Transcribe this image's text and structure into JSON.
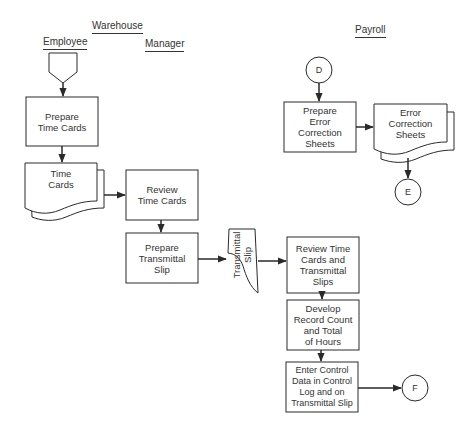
{
  "lanes": {
    "warehouse": "Warehouse",
    "employee": "Employee",
    "manager": "Manager",
    "payroll": "Payroll"
  },
  "nodes": {
    "prepare_time_cards": {
      "type": "process",
      "line1": "Prepare",
      "line2": "Time Cards"
    },
    "time_cards": {
      "type": "document-multiple",
      "line1": "Time",
      "line2": "Cards"
    },
    "review_time_cards": {
      "type": "process",
      "line1": "Review",
      "line2": "Time Cards"
    },
    "prepare_transmittal_slip": {
      "type": "process",
      "line1": "Prepare",
      "line2": "Transmittal",
      "line3": "Slip"
    },
    "transmittal_slip": {
      "type": "document",
      "line1": "Transmittal",
      "line2": "Slip"
    },
    "review_time_cards_slips": {
      "type": "process",
      "line1": "Review Time",
      "line2": "Cards and",
      "line3": "Transmittal",
      "line4": "Slips"
    },
    "develop_record_count": {
      "type": "process",
      "line1": "Develop",
      "line2": "Record Count",
      "line3": "and Total",
      "line4": "of Hours"
    },
    "enter_control_data": {
      "type": "process",
      "line1": "Enter Control",
      "line2": "Data in Control",
      "line3": "Log and on",
      "line4": "Transmittal Slip"
    },
    "prepare_error_correction": {
      "type": "process",
      "line1": "Prepare",
      "line2": "Error",
      "line3": "Correction",
      "line4": "Sheets"
    },
    "error_correction_sheets": {
      "type": "document-multiple",
      "line1": "Error",
      "line2": "Correction",
      "line3": "Sheets"
    }
  },
  "connectors": {
    "start": {
      "type": "off-page-connector",
      "label": ""
    },
    "D": {
      "type": "on-page-connector",
      "label": "D"
    },
    "E": {
      "type": "on-page-connector",
      "label": "E"
    },
    "F": {
      "type": "on-page-connector",
      "label": "F"
    }
  },
  "edges": [
    [
      "start",
      "prepare_time_cards"
    ],
    [
      "prepare_time_cards",
      "time_cards"
    ],
    [
      "time_cards",
      "review_time_cards"
    ],
    [
      "review_time_cards",
      "prepare_transmittal_slip"
    ],
    [
      "prepare_transmittal_slip",
      "transmittal_slip"
    ],
    [
      "transmittal_slip",
      "review_time_cards_slips"
    ],
    [
      "review_time_cards_slips",
      "develop_record_count"
    ],
    [
      "develop_record_count",
      "enter_control_data"
    ],
    [
      "enter_control_data",
      "F"
    ],
    [
      "D",
      "prepare_error_correction"
    ],
    [
      "prepare_error_correction",
      "error_correction_sheets"
    ],
    [
      "error_correction_sheets",
      "E"
    ]
  ],
  "colors": {
    "line": "#2a2a2a",
    "background": "#ffffff"
  }
}
